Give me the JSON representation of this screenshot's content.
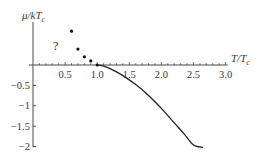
{
  "chart_data": {
    "type": "line",
    "title": "",
    "xlabel": "T/T",
    "xlabel_sub": "c",
    "ylabel": "μ/kT",
    "ylabel_sub": "c",
    "xlim": [
      0,
      3.0
    ],
    "ylim": [
      -2,
      1
    ],
    "grid": false,
    "legend": null,
    "x_ticks": [
      0.5,
      1.0,
      1.5,
      2.0,
      2.5,
      3.0
    ],
    "x_tick_labels": [
      "0.5",
      "1.0",
      "1.5",
      "2.0",
      "2.5",
      "3.0"
    ],
    "x_minor_step": 0.1,
    "y_ticks": [
      -0.5,
      -1,
      -1.5,
      -2
    ],
    "y_tick_labels": [
      "-0.5",
      "-1",
      "-1.5",
      "-2"
    ],
    "annotations": [
      {
        "text": "?",
        "x": 0.37,
        "y": 0.5
      }
    ],
    "series": [
      {
        "name": "dots (T < Tc, uncertain)",
        "style": "points",
        "x": [
          0.6,
          0.7,
          0.8,
          0.9,
          1.0
        ],
        "y": [
          0.83,
          0.39,
          0.2,
          0.1,
          0.0
        ]
      },
      {
        "name": "mu curve (T > Tc)",
        "style": "line",
        "x": [
          1.0,
          1.1,
          1.2,
          1.3,
          1.43,
          1.6,
          1.74,
          1.9,
          2.05,
          2.2,
          2.36,
          2.5,
          2.65
        ],
        "y": [
          0.0,
          -0.03,
          -0.09,
          -0.17,
          -0.29,
          -0.48,
          -0.66,
          -0.9,
          -1.15,
          -1.42,
          -1.7,
          -1.96,
          -2.02
        ]
      }
    ]
  }
}
